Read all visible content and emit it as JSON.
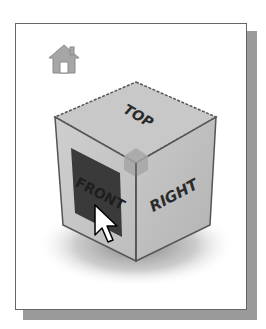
{
  "viewcube": {
    "faces": {
      "top": "TOP",
      "front": "FRONT",
      "right": "RIGHT"
    },
    "highlighted_face": "FRONT",
    "colors": {
      "face": "#c8c8c8",
      "face_right": "#bdbdbd",
      "highlight": "#3a3a3a",
      "edge": "#555555",
      "home_icon": "#9a9a9a",
      "corner_highlight": "#a8a8a8"
    }
  },
  "home_button": {
    "icon": "home-icon"
  },
  "cursor": {
    "icon": "arrow-cursor-icon"
  }
}
